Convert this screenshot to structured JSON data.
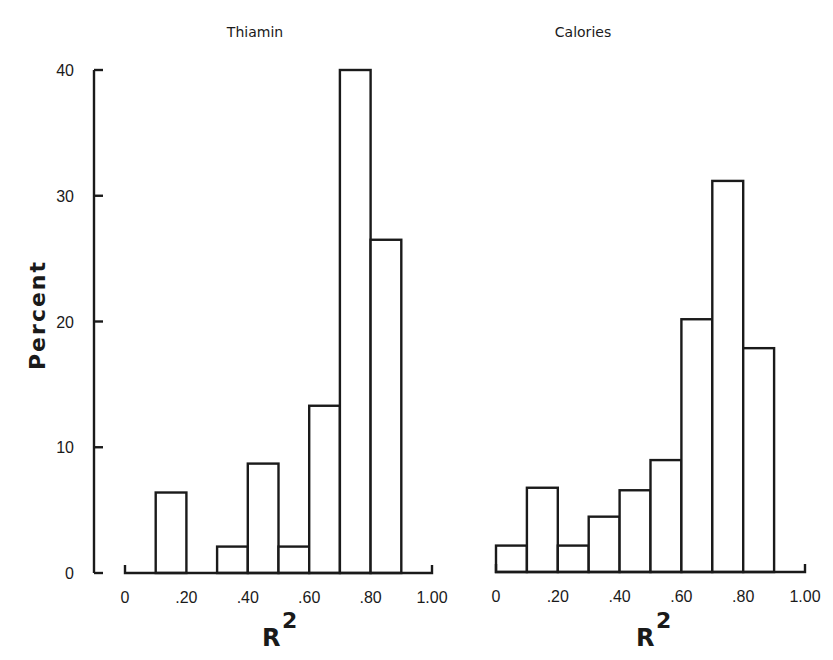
{
  "figure": {
    "ylabel": "Percent",
    "background": "#ffffff",
    "ink": "#1a1a1a"
  },
  "chart_data": [
    {
      "type": "bar",
      "title": "Thiamin",
      "xlabel": "R",
      "xlabel_superscript": "2",
      "ylabel": "Percent",
      "bin_edges": [
        0,
        0.1,
        0.2,
        0.3,
        0.4,
        0.5,
        0.6,
        0.7,
        0.8,
        0.9,
        1.0
      ],
      "categories": [
        "0-.10",
        ".10-.20",
        ".20-.30",
        ".30-.40",
        ".40-.50",
        ".50-.60",
        ".60-.70",
        ".70-.80",
        ".80-.90",
        ".90-1.00"
      ],
      "values": [
        0,
        6.4,
        0,
        2.1,
        8.7,
        2.1,
        13.3,
        40.0,
        26.5,
        0
      ],
      "xticks": [
        "0",
        ".20",
        ".40",
        ".60",
        ".80",
        "1.00"
      ],
      "yticks": [
        "0",
        "10",
        "20",
        "30",
        "40"
      ],
      "xlim": [
        0,
        1.0
      ],
      "ylim": [
        0,
        40
      ],
      "grid": false
    },
    {
      "type": "bar",
      "title": "Calories",
      "xlabel": "R",
      "xlabel_superscript": "2",
      "ylabel": "Percent",
      "bin_edges": [
        0,
        0.1,
        0.2,
        0.3,
        0.4,
        0.5,
        0.6,
        0.7,
        0.8,
        0.9,
        1.0
      ],
      "categories": [
        "0-.10",
        ".10-.20",
        ".20-.30",
        ".30-.40",
        ".40-.50",
        ".50-.60",
        ".60-.70",
        ".70-.80",
        ".80-.90",
        ".90-1.00"
      ],
      "values": [
        2.1,
        6.7,
        2.1,
        4.4,
        6.5,
        8.9,
        20.1,
        31.1,
        17.8,
        0
      ],
      "xticks": [
        "0",
        ".20",
        ".40",
        ".60",
        ".80",
        "1.00"
      ],
      "yticks": [],
      "xlim": [
        0,
        1.0
      ],
      "ylim": [
        0,
        40
      ],
      "grid": false
    }
  ]
}
